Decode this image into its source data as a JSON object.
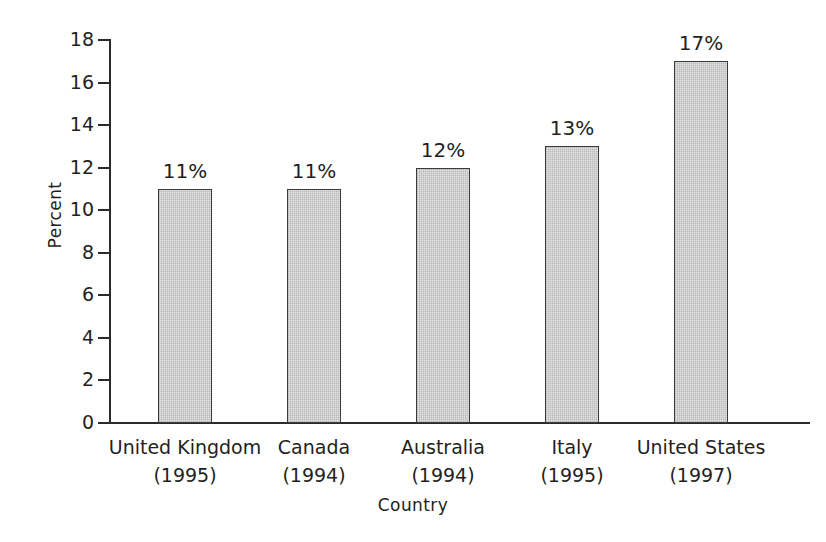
{
  "chart_data": {
    "type": "bar",
    "title": "",
    "xlabel": "Country",
    "ylabel": "Percent",
    "categories": [
      "United Kingdom",
      "Canada",
      "Australia",
      "Italy",
      "United States"
    ],
    "category_years": [
      "(1995)",
      "(1994)",
      "(1994)",
      "(1995)",
      "(1997)"
    ],
    "category_labels": [
      "United Kingdom (1995)",
      "Canada (1994)",
      "Australia (1994)",
      "Italy (1995)",
      "United States (1997)"
    ],
    "values": [
      11,
      11,
      12,
      13,
      17
    ],
    "value_labels": [
      "11%",
      "11%",
      "12%",
      "13%",
      "17%"
    ],
    "ylim": [
      0,
      18
    ],
    "ytick_step": 2,
    "ytick_labels": [
      "0",
      "2",
      "4",
      "6",
      "8",
      "10",
      "12",
      "14",
      "16",
      "18"
    ],
    "ytick_values": [
      0,
      2,
      4,
      6,
      8,
      10,
      12,
      14,
      16,
      18
    ],
    "grid": false,
    "legend": false,
    "legend_position": "none",
    "series": [
      {
        "name": "Percent",
        "values": [
          11,
          11,
          12,
          13,
          17
        ]
      }
    ],
    "colors": {
      "bar_fill": "#e4e4e4",
      "bar_border": "#3a3a3a",
      "axis": "#2b2b2b",
      "text": "#231f20",
      "background": "#ffffff"
    }
  }
}
